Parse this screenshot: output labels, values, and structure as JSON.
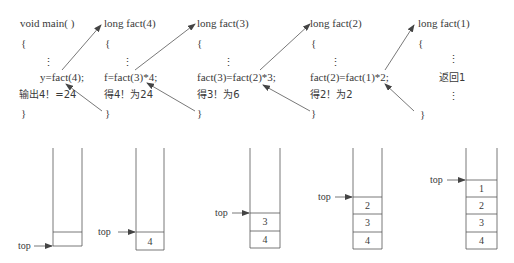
{
  "frames": [
    {
      "header": "void main( )",
      "open_brace": "{",
      "ellipsis": "⋮",
      "call_line": "y=fact(4);",
      "result_line": "输出4！=24",
      "close_brace": "}"
    },
    {
      "header": "long fact(4)",
      "open_brace": "{",
      "ellipsis": "⋮",
      "call_line": "f=fact(3)*4;",
      "result_line": "得4！为24",
      "close_brace": "}"
    },
    {
      "header": "long fact(3)",
      "open_brace": "{",
      "ellipsis": "⋮",
      "call_line": "fact(3)=fact(2)*3;",
      "result_line": "得3！为6",
      "close_brace": "}"
    },
    {
      "header": "long fact(2)",
      "open_brace": "{",
      "ellipsis": "⋮",
      "call_line": "fact(2)=fact(1)*2;",
      "result_line": "得2！为2",
      "close_brace": "}"
    },
    {
      "header": "long fact(1)",
      "open_brace": "{",
      "ellipsis": "⋮",
      "call_line": "返回1",
      "ellipsis2": "⋮",
      "close_brace": "}"
    }
  ],
  "stacks": [
    {
      "top_label": "top",
      "cells": []
    },
    {
      "top_label": "top",
      "cells": [
        "4"
      ]
    },
    {
      "top_label": "top",
      "cells": [
        "3",
        "4"
      ]
    },
    {
      "top_label": "top",
      "cells": [
        "2",
        "3",
        "4"
      ]
    },
    {
      "top_label": "top",
      "cells": [
        "1",
        "2",
        "3",
        "4"
      ]
    }
  ],
  "colors": {
    "line": "#555555",
    "text": "#3a3a3a"
  }
}
